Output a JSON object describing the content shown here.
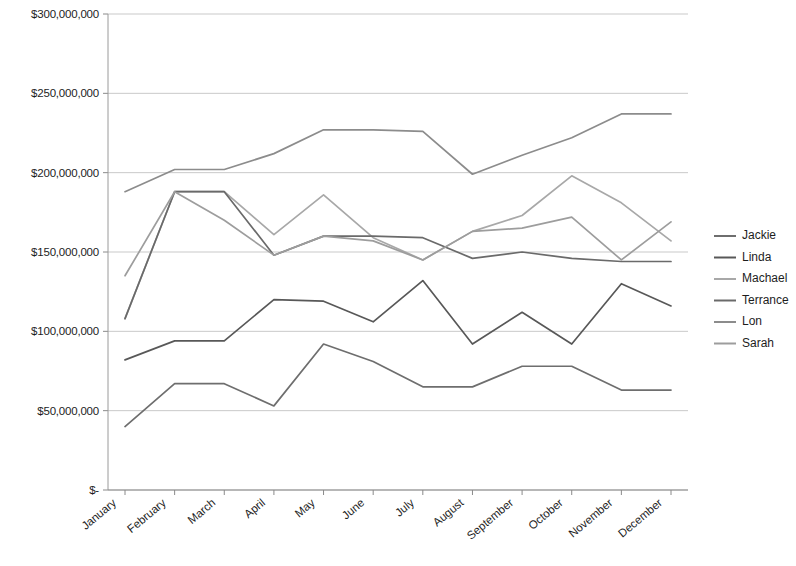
{
  "chart_data": {
    "type": "line",
    "title": "",
    "xlabel": "",
    "ylabel": "",
    "grid": true,
    "legend_position": "right",
    "ylim": [
      0,
      300000000
    ],
    "ytick_step": 50000000,
    "ytick_labels": [
      "$300,000,000",
      "$250,000,000",
      "$200,000,000",
      "$150,000,000",
      "$100,000,000",
      "$50,000,000",
      "$-"
    ],
    "ytick_values": [
      300000000,
      250000000,
      200000000,
      150000000,
      100000000,
      50000000,
      0
    ],
    "categories": [
      "January",
      "February",
      "March",
      "April",
      "May",
      "June",
      "July",
      "August",
      "September",
      "October",
      "November",
      "December"
    ],
    "series": [
      {
        "name": "Jackie",
        "color": "#6e6e6e",
        "values": [
          40000000,
          67000000,
          67000000,
          53000000,
          92000000,
          81000000,
          65000000,
          65000000,
          78000000,
          78000000,
          63000000,
          63000000
        ]
      },
      {
        "name": "Linda",
        "color": "#585858",
        "values": [
          82000000,
          94000000,
          94000000,
          120000000,
          119000000,
          106000000,
          132000000,
          92000000,
          112000000,
          92000000,
          130000000,
          116000000
        ]
      },
      {
        "name": "Machael",
        "color": "#a8a8a8",
        "values": [
          108000000,
          188000000,
          188000000,
          161000000,
          186000000,
          159000000,
          145000000,
          163000000,
          173000000,
          198000000,
          181000000,
          157000000
        ]
      },
      {
        "name": "Terrance",
        "color": "#6a6a6a",
        "values": [
          108000000,
          188000000,
          188000000,
          148000000,
          160000000,
          160000000,
          159000000,
          146000000,
          150000000,
          146000000,
          144000000,
          144000000
        ]
      },
      {
        "name": "Lon",
        "color": "#8c8c8c",
        "values": [
          188000000,
          202000000,
          202000000,
          212000000,
          227000000,
          227000000,
          226000000,
          199000000,
          211000000,
          222000000,
          237000000,
          237000000
        ]
      },
      {
        "name": "Sarah",
        "color": "#9d9d9d",
        "values": [
          135000000,
          188000000,
          170000000,
          148000000,
          160000000,
          157000000,
          145000000,
          163000000,
          165000000,
          172000000,
          145000000,
          169000000
        ]
      }
    ]
  }
}
